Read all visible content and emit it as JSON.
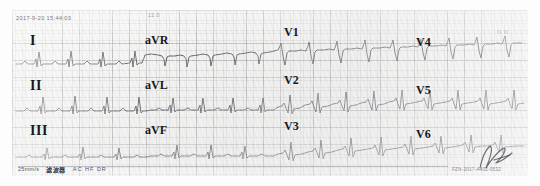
{
  "record": {
    "timestamp": "2017-9-20  15:44:03",
    "gain_mark": "12.0",
    "corner_mark": "II  II"
  },
  "leads": [
    {
      "name": "I",
      "label": "I",
      "style": "lead-roman",
      "x": 18,
      "y": 24
    },
    {
      "name": "II",
      "label": "II",
      "style": "lead-roman",
      "x": 18,
      "y": 69
    },
    {
      "name": "III",
      "label": "III",
      "style": "lead-roman",
      "x": 18,
      "y": 114
    },
    {
      "name": "aVR",
      "label": "aVR",
      "style": "lead-a",
      "x": 144,
      "y": 24
    },
    {
      "name": "aVL",
      "label": "aVL",
      "style": "lead-a",
      "x": 144,
      "y": 69
    },
    {
      "name": "aVF",
      "label": "aVF",
      "style": "lead-a",
      "x": 144,
      "y": 114
    },
    {
      "name": "V1",
      "label": "V1",
      "style": "lead-v",
      "x": 283,
      "y": 16
    },
    {
      "name": "V2",
      "label": "V2",
      "style": "lead-v",
      "x": 283,
      "y": 64
    },
    {
      "name": "V3",
      "label": "V3",
      "style": "lead-v",
      "x": 283,
      "y": 110
    },
    {
      "name": "V4",
      "label": "V4",
      "style": "lead-v",
      "x": 415,
      "y": 26
    },
    {
      "name": "V5",
      "label": "V5",
      "style": "lead-v",
      "x": 415,
      "y": 74
    },
    {
      "name": "V6",
      "label": "V6",
      "style": "lead-v",
      "x": 415,
      "y": 118
    }
  ],
  "footer": {
    "paper_speed": "25mm/s",
    "filter_label": "滤波器",
    "filter_codes": "AC  HF  DR",
    "serial": "FZN-2017-A402-0532"
  }
}
